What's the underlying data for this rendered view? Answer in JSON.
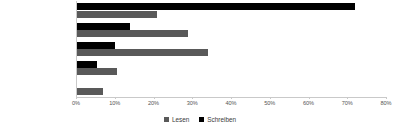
{
  "chart_data": {
    "type": "bar",
    "orientation": "horizontal",
    "title": "",
    "xlabel": "",
    "ylabel": "",
    "xlim": [
      0,
      80
    ],
    "xtick_labels": [
      "0%",
      "10%",
      "20%",
      "30%",
      "40%",
      "50%",
      "60%",
      "70%",
      "80%"
    ],
    "xtick_values": [
      0,
      10,
      20,
      30,
      40,
      50,
      60,
      70,
      80
    ],
    "grid": false,
    "legend_position": "bottom-center",
    "categories": [
      "seltener als monatlich",
      "monatlich",
      "wöchentlich",
      "täglich",
      "mehrmals täglich"
    ],
    "series": [
      {
        "name": "Schreiben",
        "color": "#000000",
        "values": [
          72,
          14,
          10,
          5.5,
          0
        ]
      },
      {
        "name": "Lesen",
        "color": "#595959",
        "values": [
          21,
          29,
          34,
          10.5,
          7
        ]
      }
    ]
  },
  "legend": {
    "items": [
      {
        "label": "Lesen",
        "swatch": "lesen"
      },
      {
        "label": "Schreiben",
        "swatch": "schreiben"
      }
    ]
  }
}
